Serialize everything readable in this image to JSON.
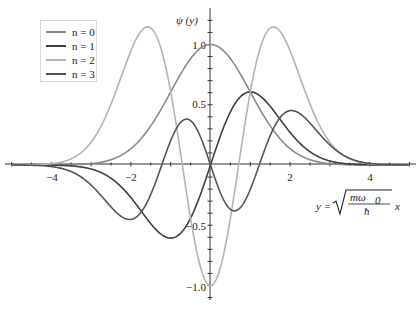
{
  "chart_data": {
    "type": "line",
    "title": "",
    "xlabel": "y = sqrt(m ω0 / ħ) x",
    "ylabel": "ψ (y)",
    "xlim": [
      -5,
      5
    ],
    "ylim": [
      -1.1,
      1.2
    ],
    "x_ticks": [
      -4,
      -2,
      2,
      4
    ],
    "y_ticks": [
      -1.0,
      -0.5,
      0.5,
      1.0
    ],
    "grid": false,
    "legend_position": "upper-left",
    "series": [
      {
        "name": "n = 0",
        "color": "#8a8a8a",
        "formula": "exp(-y^2/2)",
        "x": [
          -4,
          -3,
          -2,
          -1.5,
          -1,
          -0.5,
          0,
          0.5,
          1,
          1.5,
          2,
          3,
          4
        ],
        "values": [
          0.0003,
          0.011,
          0.135,
          0.325,
          0.607,
          0.882,
          1.0,
          0.882,
          0.607,
          0.325,
          0.135,
          0.011,
          0.0003
        ]
      },
      {
        "name": "n = 1",
        "color": "#404040",
        "formula": "y*exp(-y^2/2)",
        "x": [
          -4,
          -3,
          -2,
          -1.5,
          -1,
          -0.5,
          0,
          0.5,
          1,
          1.5,
          2,
          3,
          4
        ],
        "values": [
          -0.001,
          -0.033,
          -0.271,
          -0.487,
          -0.607,
          -0.441,
          0.0,
          0.441,
          0.607,
          0.487,
          0.271,
          0.033,
          0.001
        ]
      },
      {
        "name": "n = 2",
        "color": "#b4b4b4",
        "formula": "(2y^2-1)*exp(-y^2/2)",
        "x": [
          -4,
          -3,
          -2,
          -1.58,
          -1,
          -0.5,
          0,
          0.5,
          1,
          1.58,
          2,
          3,
          4
        ],
        "values": [
          0.01,
          0.188,
          0.947,
          1.146,
          0.607,
          -0.441,
          -1.0,
          -0.441,
          0.607,
          1.146,
          0.947,
          0.188,
          0.01
        ]
      },
      {
        "name": "n = 3",
        "color": "#555555",
        "formula": "(2y^3-3y)*exp(-y^2/2)/3",
        "x": [
          -4,
          -3,
          -2.1,
          -1.5,
          -1,
          -0.6,
          0,
          0.6,
          1,
          1.5,
          2.1,
          3,
          4
        ],
        "values": [
          -0.013,
          -0.164,
          -0.45,
          -0.24,
          0.202,
          0.381,
          0.0,
          -0.381,
          -0.202,
          0.24,
          0.45,
          0.164,
          0.013
        ]
      }
    ]
  },
  "axes": {
    "x_tick_labels": [
      "−4",
      "−2",
      "2",
      "4"
    ],
    "y_tick_labels": [
      "1.0",
      "0.5",
      "−0.5",
      "−1.0"
    ],
    "ylabel_text": "ψ (y)",
    "xlabel_prefix": "y = ",
    "xlabel_num": "mω",
    "xlabel_sub": "0",
    "xlabel_den": "ħ",
    "xlabel_suffix": "x"
  },
  "legend": {
    "items": [
      {
        "label": "n = 0",
        "color": "#8a8a8a"
      },
      {
        "label": "n = 1",
        "color": "#404040"
      },
      {
        "label": "n = 2",
        "color": "#b4b4b4"
      },
      {
        "label": "n = 3",
        "color": "#555555"
      }
    ]
  }
}
